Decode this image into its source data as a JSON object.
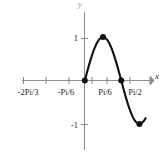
{
  "chart_data": {
    "type": "line",
    "title": "",
    "subtitle": "",
    "xlabel": "x",
    "ylabel": "y",
    "xlim": [
      -2.0944,
      1.7453
    ],
    "ylim": [
      -1.45,
      1.45
    ],
    "grid": false,
    "legend": null,
    "x_tick_labels": [
      "-2Pi/3",
      "-Pi/6",
      "Pi/6",
      "Pi/2"
    ],
    "x_tick_values": [
      -2.0944,
      -0.5236,
      0.5236,
      1.5708
    ],
    "y_tick_labels": [
      "1",
      "-1"
    ],
    "y_tick_values": [
      1,
      -1
    ],
    "unlabeled_x_ticks": [
      -1.309,
      0.0,
      1.0472
    ],
    "series": [
      {
        "name": "y = sin(3x)",
        "color": "#111111",
        "x": [
          0.0,
          0.0654,
          0.1309,
          0.1963,
          0.2618,
          0.3272,
          0.3927,
          0.4581,
          0.5236,
          0.589,
          0.6545,
          0.7199,
          0.7854,
          0.8508,
          0.9163,
          0.9817,
          1.0472,
          1.1126,
          1.1781,
          1.2435,
          1.309,
          1.3744,
          1.4399,
          1.5053,
          1.5708,
          1.6362,
          1.7017,
          1.7453
        ],
        "y": [
          0.0,
          0.1951,
          0.3827,
          0.5556,
          0.7071,
          0.8315,
          0.9239,
          0.9808,
          1.0,
          0.9808,
          0.9239,
          0.8315,
          0.7071,
          0.5556,
          0.3827,
          0.1951,
          0.0,
          -0.1951,
          -0.3827,
          -0.5556,
          -0.7071,
          -0.8315,
          -0.9239,
          -0.9808,
          -1.0,
          -0.9808,
          -0.9239,
          -0.866
        ]
      }
    ],
    "marked_points": [
      {
        "label": "origin-zero",
        "x": 0.0,
        "y": 0.0
      },
      {
        "label": "maximum",
        "x": 0.5236,
        "y": 1.0
      },
      {
        "label": "mid-zero",
        "x": 1.0472,
        "y": 0.0
      },
      {
        "label": "minimum",
        "x": 1.5708,
        "y": -1.0
      }
    ],
    "colors": {
      "curve": "#111111",
      "axis": "#8d8d8d",
      "tick": "#8d8d8d",
      "point": "#111111",
      "text": "#1d1d1d",
      "background": "#ffffff"
    }
  },
  "axis_labels": {
    "x": "x",
    "y": "y"
  },
  "x_ticks": [
    {
      "label": "-2Pi/3",
      "left_px": 28
    },
    {
      "label": "-Pi/6",
      "left_px": 66
    },
    {
      "label": "Pi/6",
      "left_px": 105
    },
    {
      "label": "Pi/2",
      "left_px": 135
    }
  ],
  "y_ticks": [
    {
      "label": "1",
      "top_px": 38
    },
    {
      "label": "-1",
      "top_px": 125
    }
  ]
}
